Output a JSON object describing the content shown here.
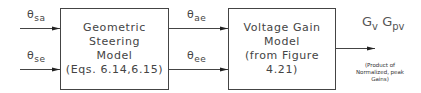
{
  "inputs": [
    {
      "symbol": "θ",
      "subscript": "sa"
    },
    {
      "symbol": "θ",
      "subscript": "se"
    }
  ],
  "block1": {
    "lines": [
      "Geometric",
      "Steering",
      "Model",
      "(Eqs. 6.14,6.15)"
    ]
  },
  "intermediate": [
    {
      "symbol": "θ",
      "subscript": "ae"
    },
    {
      "symbol": "θ",
      "subscript": "ee"
    }
  ],
  "block2": {
    "lines": [
      "Voltage Gain",
      "Model",
      "(from Figure",
      "4.21)"
    ]
  },
  "output": {
    "g1": "G",
    "g1_sub": "v",
    "g2": "G",
    "g2_sub": "pv",
    "note_lines": [
      "(Product of",
      "Normalized, peak",
      "Gains)"
    ]
  },
  "colors": {
    "line": "#444444",
    "background": "#ffffff"
  }
}
